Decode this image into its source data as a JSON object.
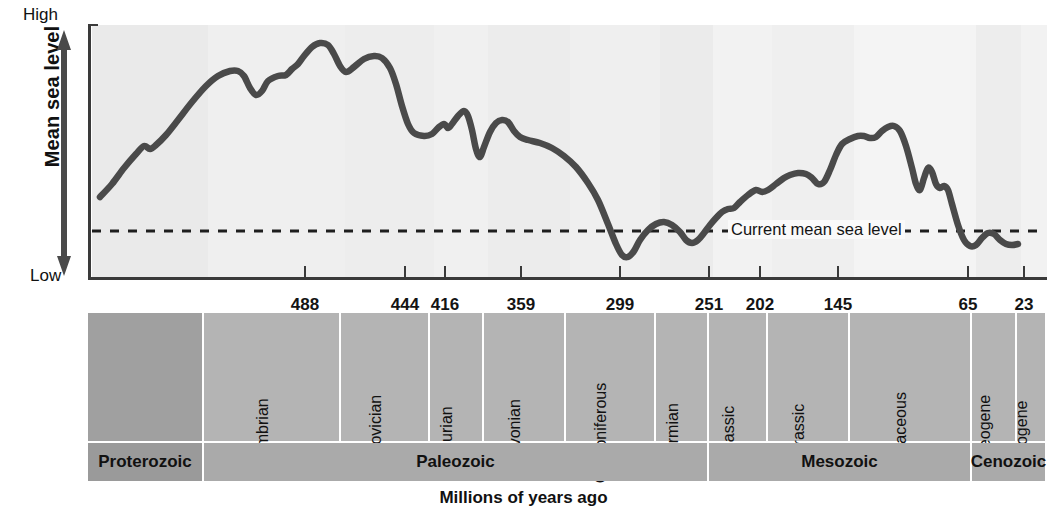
{
  "figure": {
    "x_caption": "Millions of years ago",
    "y_caption": "Mean sea level",
    "y_high_label": "High",
    "y_low_label": "Low",
    "annotation": "Current mean sea level"
  },
  "colors": {
    "curve": "#4a4a4a",
    "axis": "#3a3a3a",
    "plot_background": "#eeeeee",
    "plot_background_light": "#f6f6f6",
    "band_period": "#b4b4b4",
    "band_period_dark": "#a0a0a0",
    "band_era": "#aaaaaa",
    "band_era_dark": "#9a9a9a",
    "text": "#111111"
  },
  "chart_data": {
    "type": "line",
    "title": "",
    "xlabel": "Millions of years ago",
    "ylabel": "Mean sea level",
    "grid": false,
    "legend": "none",
    "x_axis_direction": "decreasing",
    "xlim": [
      4600,
      0
    ],
    "ylim": [
      "Low",
      "High"
    ],
    "y_tick_labels": [
      "Low",
      "High"
    ],
    "x_tick_labels": [
      "488",
      "444",
      "416",
      "359",
      "299",
      "251",
      "202",
      "145",
      "65",
      "23"
    ],
    "x_tick_values": [
      488,
      444,
      416,
      359,
      299,
      251,
      202,
      145,
      65,
      23
    ],
    "x_tick_px": [
      305,
      405,
      445,
      521,
      620,
      709,
      760,
      838,
      968,
      1024
    ],
    "reference_line": {
      "label": "Current mean sea level",
      "style": "dashed",
      "y_relative": 0.18
    },
    "series": [
      {
        "name": "Mean sea level",
        "description": "Phanerozoic eustatic sea-level curve",
        "points_px": [
          [
            100,
            185
          ],
          [
            112,
            172
          ],
          [
            124,
            156
          ],
          [
            136,
            142
          ],
          [
            144,
            134
          ],
          [
            150,
            137
          ],
          [
            156,
            133
          ],
          [
            166,
            123
          ],
          [
            178,
            108
          ],
          [
            192,
            90
          ],
          [
            206,
            74
          ],
          [
            218,
            64
          ],
          [
            230,
            59
          ],
          [
            238,
            59
          ],
          [
            244,
            64
          ],
          [
            250,
            76
          ],
          [
            256,
            83
          ],
          [
            262,
            79
          ],
          [
            268,
            69
          ],
          [
            278,
            64
          ],
          [
            286,
            63
          ],
          [
            292,
            57
          ],
          [
            298,
            52
          ],
          [
            304,
            44
          ],
          [
            312,
            35
          ],
          [
            320,
            31
          ],
          [
            328,
            33
          ],
          [
            334,
            42
          ],
          [
            340,
            54
          ],
          [
            346,
            60
          ],
          [
            354,
            55
          ],
          [
            364,
            47
          ],
          [
            374,
            44
          ],
          [
            382,
            46
          ],
          [
            390,
            56
          ],
          [
            396,
            72
          ],
          [
            402,
            94
          ],
          [
            408,
            112
          ],
          [
            414,
            121
          ],
          [
            424,
            124
          ],
          [
            432,
            122
          ],
          [
            438,
            116
          ],
          [
            444,
            112
          ],
          [
            448,
            116
          ],
          [
            452,
            112
          ],
          [
            458,
            104
          ],
          [
            464,
            99
          ],
          [
            468,
            104
          ],
          [
            472,
            118
          ],
          [
            476,
            137
          ],
          [
            480,
            145
          ],
          [
            484,
            135
          ],
          [
            490,
            120
          ],
          [
            496,
            111
          ],
          [
            502,
            108
          ],
          [
            508,
            110
          ],
          [
            514,
            119
          ],
          [
            520,
            125
          ],
          [
            528,
            128
          ],
          [
            540,
            131
          ],
          [
            552,
            136
          ],
          [
            564,
            144
          ],
          [
            576,
            155
          ],
          [
            588,
            171
          ],
          [
            598,
            188
          ],
          [
            608,
            212
          ],
          [
            616,
            232
          ],
          [
            622,
            243
          ],
          [
            628,
            245
          ],
          [
            634,
            239
          ],
          [
            640,
            228
          ],
          [
            648,
            218
          ],
          [
            656,
            212
          ],
          [
            664,
            210
          ],
          [
            672,
            213
          ],
          [
            680,
            220
          ],
          [
            686,
            228
          ],
          [
            692,
            231
          ],
          [
            698,
            228
          ],
          [
            704,
            221
          ],
          [
            710,
            213
          ],
          [
            716,
            206
          ],
          [
            722,
            200
          ],
          [
            728,
            197
          ],
          [
            734,
            196
          ],
          [
            740,
            190
          ],
          [
            748,
            183
          ],
          [
            756,
            178
          ],
          [
            762,
            180
          ],
          [
            768,
            178
          ],
          [
            776,
            172
          ],
          [
            784,
            166
          ],
          [
            790,
            163
          ],
          [
            798,
            161
          ],
          [
            806,
            162
          ],
          [
            812,
            166
          ],
          [
            818,
            172
          ],
          [
            824,
            170
          ],
          [
            830,
            158
          ],
          [
            836,
            143
          ],
          [
            842,
            132
          ],
          [
            850,
            127
          ],
          [
            858,
            124
          ],
          [
            864,
            124
          ],
          [
            870,
            126
          ],
          [
            876,
            125
          ],
          [
            882,
            119
          ],
          [
            888,
            115
          ],
          [
            894,
            114
          ],
          [
            900,
            119
          ],
          [
            906,
            134
          ],
          [
            912,
            156
          ],
          [
            916,
            172
          ],
          [
            920,
            178
          ],
          [
            924,
            166
          ],
          [
            928,
            156
          ],
          [
            932,
            160
          ],
          [
            936,
            172
          ],
          [
            940,
            176
          ],
          [
            944,
            174
          ],
          [
            948,
            178
          ],
          [
            952,
            192
          ],
          [
            958,
            213
          ],
          [
            964,
            228
          ],
          [
            970,
            234
          ],
          [
            976,
            233
          ],
          [
            982,
            226
          ],
          [
            988,
            221
          ],
          [
            994,
            222
          ],
          [
            1000,
            228
          ],
          [
            1006,
            232
          ],
          [
            1012,
            233
          ],
          [
            1018,
            232
          ]
        ]
      }
    ]
  },
  "timescale": {
    "period_header": "Period",
    "era_header": "Era",
    "periods": [
      {
        "label": "",
        "x0": 0,
        "x1": 116,
        "shade": "dark",
        "blank": true
      },
      {
        "label": "Cambrian",
        "x0": 116,
        "x1": 253,
        "shade": "light"
      },
      {
        "label": "Ordovician",
        "x0": 253,
        "x1": 342,
        "shade": "light"
      },
      {
        "label": "Silurian",
        "x0": 342,
        "x1": 396,
        "shade": "light"
      },
      {
        "label": "Devonian",
        "x0": 396,
        "x1": 478,
        "shade": "light"
      },
      {
        "label": "Carboniferous",
        "x0": 478,
        "x1": 568,
        "shade": "light"
      },
      {
        "label": "Permian",
        "x0": 568,
        "x1": 621,
        "shade": "light"
      },
      {
        "label": "Triassic",
        "x0": 621,
        "x1": 680,
        "shade": "light"
      },
      {
        "label": "Jurassic",
        "x0": 680,
        "x1": 762,
        "shade": "light"
      },
      {
        "label": "Cretaceous",
        "x0": 762,
        "x1": 884,
        "shade": "light"
      },
      {
        "label": "Paleogene",
        "x0": 884,
        "x1": 929,
        "shade": "light"
      },
      {
        "label": "Neogene",
        "x0": 929,
        "x1": 959,
        "shade": "light"
      }
    ],
    "eras": [
      {
        "label": "Proterozoic",
        "x0": 0,
        "x1": 116,
        "shade": "dark"
      },
      {
        "label": "Paleozoic",
        "x0": 116,
        "x1": 621,
        "shade": "light"
      },
      {
        "label": "Mesozoic",
        "x0": 621,
        "x1": 884,
        "shade": "light"
      },
      {
        "label": "Cenozoic",
        "x0": 884,
        "x1": 959,
        "shade": "light"
      }
    ]
  }
}
